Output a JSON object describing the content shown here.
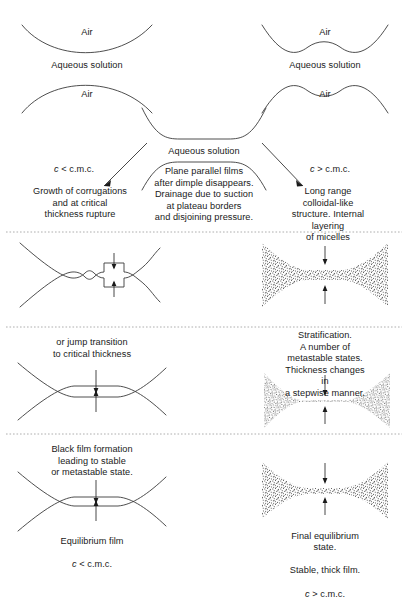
{
  "figure": {
    "width": 408,
    "height": 561,
    "stroke_color": "#3a3a3a",
    "text_color": "#1a1a1a",
    "divider_color": "#9a9a9a",
    "background": "#ffffff"
  },
  "row_top": {
    "left": {
      "air_upper": "Air",
      "aqueous": "Aqueous solution",
      "air_lower": "Air"
    },
    "right": {
      "air_upper": "Air",
      "aqueous": "Aqueous solution",
      "air_lower": "Air"
    }
  },
  "row_branch": {
    "center_aqueous": "Aqueous solution",
    "center_caption": "Plane parallel films\nafter dimple disappears.\nDrainage due to suction\nat plateau borders\nand disjoining pressure.",
    "left_condition_c": "c",
    "left_condition_op": "<",
    "left_condition_cmc": "c.m.c.",
    "right_condition_c": "c",
    "right_condition_op": ">",
    "right_condition_cmc": "c.m.c.",
    "left_caption": "Growth of corrugations\nand at critical\nthickness rupture",
    "right_caption": "Long range colloidal-like\nstructure. Internal layering\nof micelles"
  },
  "row_two": {
    "left_description": "corrugated film with critical-thickness notch",
    "right_description": "micellar stippled film, internal layering"
  },
  "row_three": {
    "left_caption": "or jump transition\nto critical thickness",
    "right_caption": "Stratification.\nA number of metastable states.\nThickness changes in\na stepwise manner."
  },
  "row_four": {
    "left_caption_top": "Black film formation\nleading to stable\nor metastable state.",
    "left_caption_bottom_line1": "Equilibrium film",
    "left_caption_c": "c",
    "left_caption_op": "<",
    "left_caption_cmc": "c.m.c.",
    "right_caption_line1": "Final equilibrium state.",
    "right_caption_line2": "Stable, thick film.",
    "right_caption_c": "c",
    "right_caption_op": ">",
    "right_caption_cmc": "c.m.c."
  }
}
